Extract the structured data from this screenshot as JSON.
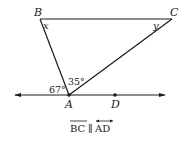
{
  "diagram": {
    "points": {
      "B": {
        "label": "B",
        "x": 40,
        "y": 19
      },
      "C": {
        "label": "C",
        "x": 172,
        "y": 19
      },
      "A": {
        "label": "A",
        "x": 69,
        "y": 95
      },
      "D": {
        "label": "D",
        "x": 115,
        "y": 95
      }
    },
    "angles": {
      "at_B": "x",
      "at_C": "y",
      "left_of_A": "67°",
      "BAC": "35°"
    },
    "caption": {
      "seg": "BC",
      "parallel": "∥",
      "line": "AD"
    },
    "colors": {
      "stroke": "#1a1a1a",
      "background": "#ffffff"
    }
  }
}
